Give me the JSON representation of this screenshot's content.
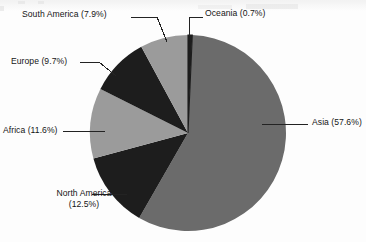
{
  "chart_data": {
    "type": "pie",
    "title": "",
    "subtitle": "",
    "xlabel": "",
    "ylabel": "",
    "legend_position": "none",
    "grid": false,
    "label_format": "{name} ({value}%)",
    "start_angle_deg": 0,
    "direction": "clockwise",
    "categories": [
      "Oceania",
      "Asia",
      "North America",
      "Africa",
      "Europe",
      "South America"
    ],
    "values": [
      0.7,
      57.6,
      12.5,
      11.6,
      9.7,
      7.9
    ],
    "total": 100.0,
    "slices": [
      {
        "name": "Oceania",
        "value": 0.7,
        "label": "Oceania (0.7%)",
        "color": "#1d1d1d",
        "start_deg": 0.0,
        "end_deg": 2.52,
        "leader": "elbow"
      },
      {
        "name": "Asia",
        "value": 57.6,
        "label": "Asia (57.6%)",
        "color": "#6b6b6b",
        "start_deg": 2.52,
        "end_deg": 209.88,
        "leader": "straight"
      },
      {
        "name": "North America",
        "value": 12.5,
        "label": "North America (12.5%)",
        "label_line_1": "North America",
        "label_line_2": "(12.5%)",
        "color": "#1d1d1d",
        "start_deg": 209.88,
        "end_deg": 254.88,
        "leader": "straight"
      },
      {
        "name": "Africa",
        "value": 11.6,
        "label": "Africa (11.6%)",
        "color": "#9b9b9b",
        "start_deg": 254.88,
        "end_deg": 296.64,
        "leader": "straight"
      },
      {
        "name": "Europe",
        "value": 9.7,
        "label": "Europe (9.7%)",
        "color": "#1d1d1d",
        "start_deg": 296.64,
        "end_deg": 331.56,
        "leader": "angled"
      },
      {
        "name": "South America",
        "value": 7.9,
        "label": "South America (7.9%)",
        "color": "#9b9b9b",
        "start_deg": 331.56,
        "end_deg": 360.0,
        "leader": "angled"
      }
    ],
    "colors": {
      "background": "#fdfdfd",
      "dark_slice": "#1d1d1d",
      "mid_slice": "#6b6b6b",
      "light_slice": "#9b9b9b",
      "label_text": "#151515",
      "leader_line": "#232323"
    }
  }
}
